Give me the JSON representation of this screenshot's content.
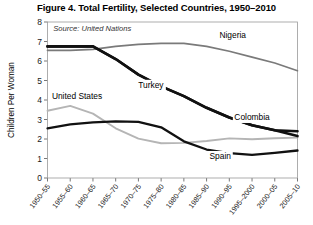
{
  "title": "Figure 4. Total Fertility, Selected Countries, 1950–2010",
  "source_note": "Source: United Nations",
  "chart_data": {
    "type": "line",
    "title": "Figure 4. Total Fertility, Selected Countries, 1950–2010",
    "xlabel": "",
    "ylabel": "Children Per Woman",
    "ylim": [
      0,
      8
    ],
    "yticks": [
      "0",
      "1",
      "2",
      "3",
      "4",
      "5",
      "6",
      "7",
      "8"
    ],
    "grid": false,
    "legend": "inline-labels",
    "categories": [
      "1950–55",
      "1955–60",
      "1960–65",
      "1965–70",
      "1970–75",
      "1975–80",
      "1980–85",
      "1985–90",
      "1990–95",
      "1995–2000",
      "2000–05",
      "2005–10"
    ],
    "series": [
      {
        "name": "Nigeria",
        "color": "#7a7a7a",
        "width": 1.7,
        "values": [
          6.55,
          6.55,
          6.6,
          6.75,
          6.85,
          6.9,
          6.9,
          6.75,
          6.5,
          6.2,
          5.9,
          5.5
        ]
      },
      {
        "name": "Turkey",
        "color": "#111111",
        "width": 2.6,
        "values": [
          6.75,
          6.75,
          6.75,
          6.1,
          5.3,
          4.7,
          4.2,
          3.6,
          3.1,
          2.7,
          2.45,
          2.15
        ]
      },
      {
        "name": "Colombia",
        "color": "#111111",
        "width": 2.6,
        "values": [
          6.75,
          6.75,
          6.75,
          6.1,
          5.3,
          4.7,
          4.2,
          3.6,
          3.1,
          2.7,
          2.45,
          2.4
        ]
      },
      {
        "name": "United States",
        "color": "#b5b5b5",
        "width": 1.9,
        "values": [
          3.45,
          3.7,
          3.3,
          2.55,
          2.02,
          1.78,
          1.8,
          1.9,
          2.03,
          1.99,
          2.04,
          2.07
        ]
      },
      {
        "name": "Spain",
        "color": "#111111",
        "width": 2.3,
        "values": [
          2.55,
          2.75,
          2.85,
          2.9,
          2.88,
          2.6,
          1.88,
          1.46,
          1.28,
          1.19,
          1.29,
          1.41
        ]
      }
    ],
    "annotations": [
      {
        "text": "Nigeria",
        "x": 8.15,
        "y": 7.2
      },
      {
        "text": "Turkey",
        "x": 4.55,
        "y": 4.6
      },
      {
        "text": "United States",
        "x": 1.3,
        "y": 4.05
      },
      {
        "text": "Colombia",
        "x": 9.0,
        "y": 2.95
      },
      {
        "text": "Spain",
        "x": 7.6,
        "y": 0.95
      },
      {
        "text": "Source: United Nations",
        "x": 0.25,
        "y": 7.55
      }
    ]
  }
}
